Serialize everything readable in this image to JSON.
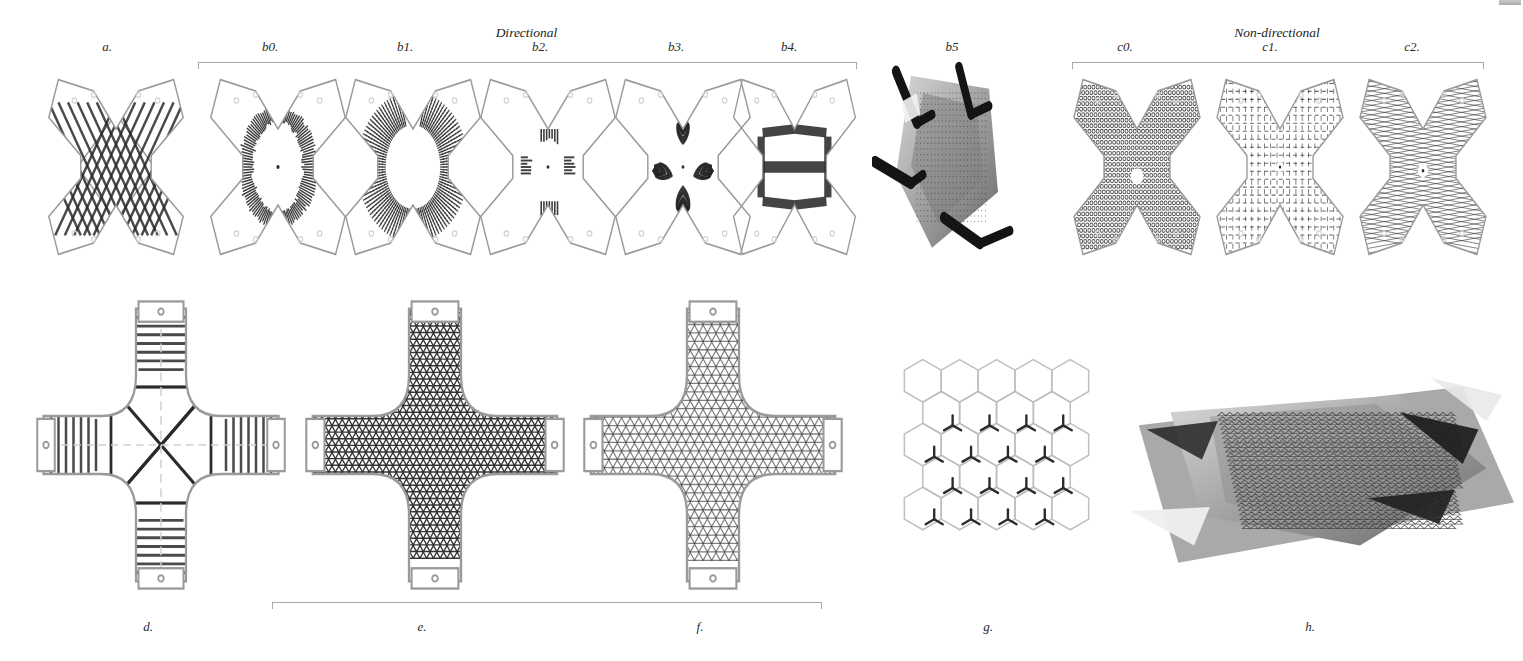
{
  "figure": {
    "caption_style": "italic-serif",
    "background": "#ffffff",
    "line_color": "#9a9a9a",
    "ink_color": "#2b2b2b",
    "bracket_color": "#a8a8a8"
  },
  "groups": [
    {
      "id": "directional",
      "label": "Directional",
      "x": 198,
      "y": 62,
      "width": 657,
      "label_y": 25
    },
    {
      "id": "non-directional",
      "label": "Non-directional",
      "x": 1072,
      "y": 62,
      "width": 410,
      "label_y": 25
    },
    {
      "id": "ef-group",
      "label": "",
      "x": 272,
      "y": 602,
      "width": 548,
      "label_y": 0
    }
  ],
  "panels": [
    {
      "id": "a",
      "label": "a.",
      "label_x": 107,
      "label_y": 40,
      "x": 36,
      "y": 72,
      "w": 160,
      "h": 190,
      "kind": "flat-pattern",
      "silhouette": "hourglass",
      "texture": "diagonal-stripes",
      "note": "unrolled hourglass panel with crossing diagonal stripe bands"
    },
    {
      "id": "b0",
      "label": "b0.",
      "label_x": 270,
      "label_y": 40,
      "x": 198,
      "y": 72,
      "w": 160,
      "h": 190,
      "kind": "flat-pattern",
      "silhouette": "hourglass",
      "texture": "ellipse-ring",
      "note": "single elliptical ring of dense hatch around centre point"
    },
    {
      "id": "b1",
      "label": "b1.",
      "label_x": 405,
      "label_y": 40,
      "x": 333,
      "y": 72,
      "w": 160,
      "h": 190,
      "kind": "flat-pattern",
      "silhouette": "hourglass",
      "texture": "broad-band",
      "note": "wide curved band following the waist of the silhouette"
    },
    {
      "id": "b2",
      "label": "b2.",
      "label_x": 540,
      "label_y": 40,
      "x": 468,
      "y": 72,
      "w": 160,
      "h": 190,
      "kind": "flat-pattern",
      "silhouette": "hourglass",
      "texture": "four-line-clusters",
      "note": "four small clusters of parallel lines N/S/E/W of centre"
    },
    {
      "id": "b3",
      "label": "b3.",
      "label_x": 676,
      "label_y": 40,
      "x": 603,
      "y": 72,
      "w": 160,
      "h": 190,
      "kind": "flat-pattern",
      "silhouette": "hourglass",
      "texture": "triangular-fans",
      "note": "dense triangular fans converging toward centre"
    },
    {
      "id": "b4",
      "label": "b4.",
      "label_x": 789,
      "label_y": 40,
      "x": 722,
      "y": 72,
      "w": 145,
      "h": 190,
      "kind": "flat-pattern",
      "silhouette": "hourglass",
      "texture": "thick-bands",
      "note": "thick diagonal bands forming an X plus one horizontal band"
    },
    {
      "id": "b5",
      "label": "b5",
      "label_x": 952,
      "label_y": 40,
      "x": 872,
      "y": 50,
      "w": 150,
      "h": 215,
      "kind": "photograph",
      "subject": "clamped-physical-model",
      "note": "greyscale photo of the fabricated shell held by bar clamps"
    },
    {
      "id": "c0",
      "label": "c0.",
      "label_x": 1125,
      "label_y": 40,
      "x": 1062,
      "y": 72,
      "w": 150,
      "h": 190,
      "kind": "flat-pattern",
      "silhouette": "hourglass",
      "texture": "dense-cell-dots",
      "note": "dense isotropic cellular dot texture, circular hole at centre"
    },
    {
      "id": "c1",
      "label": "c1.",
      "label_x": 1270,
      "label_y": 40,
      "x": 1205,
      "y": 72,
      "w": 150,
      "h": 190,
      "kind": "flat-pattern",
      "silhouette": "hourglass",
      "texture": "cross-hatch-lattice",
      "note": "open orthogonal cross-hatched lattice"
    },
    {
      "id": "c2",
      "label": "c2.",
      "label_x": 1412,
      "label_y": 40,
      "x": 1348,
      "y": 72,
      "w": 150,
      "h": 190,
      "kind": "flat-pattern",
      "silhouette": "hourglass",
      "texture": "fine-grid-dots",
      "note": "fine diagonal grid weave, small hexagonal hole at centre"
    },
    {
      "id": "d",
      "label": "d.",
      "label_x": 148,
      "label_y": 620,
      "x": 36,
      "y": 300,
      "w": 250,
      "h": 290,
      "kind": "flat-pattern",
      "silhouette": "cross",
      "texture": "rib-lines-square-diagonals",
      "note": "cross net: central square with diagonals and perpendicular rib lines on each arm"
    },
    {
      "id": "e",
      "label": "e.",
      "label_x": 422,
      "label_y": 620,
      "x": 305,
      "y": 300,
      "w": 260,
      "h": 290,
      "kind": "flat-pattern",
      "silhouette": "cross",
      "texture": "dense-triangulated-mesh",
      "note": "four-armed cross, dense triangulated mesh, rectangular tabs at arm ends"
    },
    {
      "id": "f",
      "label": "f.",
      "label_x": 700,
      "label_y": 620,
      "x": 583,
      "y": 300,
      "w": 260,
      "h": 290,
      "kind": "flat-pattern",
      "silhouette": "cross",
      "texture": "light-triangulated-mesh",
      "note": "same cross, lighter / coarser triangulated mesh, rectangular tabs"
    },
    {
      "id": "g",
      "label": "g.",
      "label_x": 988,
      "label_y": 620,
      "x": 900,
      "y": 358,
      "w": 190,
      "h": 190,
      "kind": "flat-pattern",
      "silhouette": "hex-grid",
      "texture": "hexagons-with-y-marks",
      "note": "honeycomb of light hexagons overlaid with dark tri-radial Y marks"
    },
    {
      "id": "h",
      "label": "h.",
      "label_x": 1310,
      "label_y": 620,
      "x": 1123,
      "y": 365,
      "w": 395,
      "h": 215,
      "kind": "photograph",
      "subject": "formed-mesh-shell",
      "note": "greyscale photo of the formed triangulated mesh shell on a base sheet"
    }
  ],
  "chart_data": {
    "type": "table",
    "columns": [
      "panel",
      "group",
      "representation",
      "pattern"
    ],
    "rows": [
      [
        "a.",
        "",
        "flat pattern",
        "diagonal stripes"
      ],
      [
        "b0.",
        "Directional",
        "flat pattern",
        "ellipse ring"
      ],
      [
        "b1.",
        "Directional",
        "flat pattern",
        "broad band"
      ],
      [
        "b2.",
        "Directional",
        "flat pattern",
        "four line clusters"
      ],
      [
        "b3.",
        "Directional",
        "flat pattern",
        "triangular fans"
      ],
      [
        "b4.",
        "Directional",
        "flat pattern",
        "thick bands"
      ],
      [
        "b5",
        "Directional",
        "photograph",
        "clamped physical model"
      ],
      [
        "c0.",
        "Non-directional",
        "flat pattern",
        "dense cell dots"
      ],
      [
        "c1.",
        "Non-directional",
        "flat pattern",
        "cross hatch lattice"
      ],
      [
        "c2.",
        "Non-directional",
        "flat pattern",
        "fine grid dots"
      ],
      [
        "d.",
        "",
        "flat pattern",
        "rib lines, square, diagonals"
      ],
      [
        "e.",
        "",
        "flat pattern",
        "dense triangulated mesh"
      ],
      [
        "f.",
        "",
        "flat pattern",
        "light triangulated mesh"
      ],
      [
        "g.",
        "",
        "flat pattern",
        "hexagons with Y marks"
      ],
      [
        "h.",
        "",
        "photograph",
        "formed mesh shell"
      ]
    ]
  }
}
